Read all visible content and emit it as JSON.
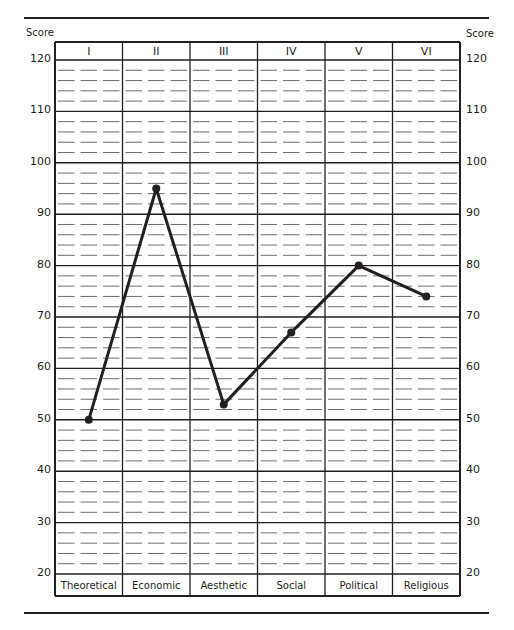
{
  "chart_data": {
    "type": "line",
    "title": "",
    "xlabel": "",
    "ylabel": "Score",
    "ylabel_right": "Score",
    "ylim": [
      20,
      120
    ],
    "yticks": [
      20,
      30,
      40,
      50,
      60,
      70,
      80,
      90,
      100,
      110,
      120
    ],
    "minor_divisions_per_major": 5,
    "grid": true,
    "legend": "none",
    "column_headers": [
      "I",
      "II",
      "III",
      "IV",
      "V",
      "VI"
    ],
    "categories": [
      "Theoretical",
      "Economic",
      "Aesthetic",
      "Social",
      "Political",
      "Religious"
    ],
    "series": [
      {
        "name": "Score",
        "values": [
          50,
          95,
          53,
          67,
          80,
          74
        ],
        "color": "#231f20",
        "marker": "circle"
      }
    ]
  },
  "layout": {
    "line_color": "#231f20",
    "dash_color": "#6d6e71"
  }
}
